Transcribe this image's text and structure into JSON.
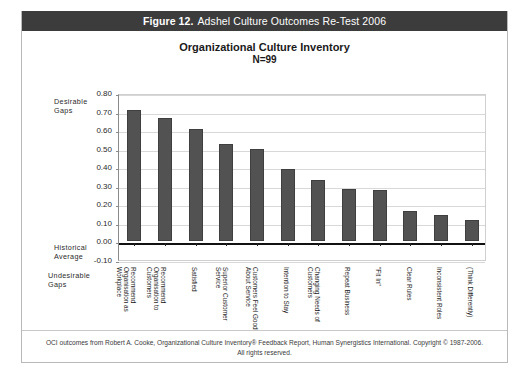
{
  "figure": {
    "number_label": "Figure 12.",
    "caption": "Adshel Culture Outcomes Re-Test 2006"
  },
  "chart_title": "Organizational Culture Inventory",
  "chart_subtitle": "N=99",
  "annotations": {
    "desirable": "Desirable\nGaps",
    "desirable_line1": "Desirable",
    "desirable_line2": "Gaps",
    "historical_line1": "Historical",
    "historical_line2": "Average",
    "undesirable_line1": "Undesirable",
    "undesirable_line2": "Gaps"
  },
  "footer": {
    "line1": "OCI outcomes from Robert A. Cooke, Organizational Culture Inventory® Feedback Report, Human Synergistics International. Copyright © 1987-2006.",
    "line2": "All rights reserved."
  },
  "chart_data": {
    "type": "bar",
    "title": "Organizational Culture Inventory",
    "subtitle": "N=99",
    "xlabel": "",
    "ylabel": "",
    "ylim": [
      -0.1,
      0.8
    ],
    "ytick_labels": [
      "0.80",
      "0.70",
      "0.60",
      "0.50",
      "0.40",
      "0.30",
      "0.20",
      "0.10",
      "0.00",
      "-0.10"
    ],
    "ytick_values": [
      0.8,
      0.7,
      0.6,
      0.5,
      0.4,
      0.3,
      0.2,
      0.1,
      0.0,
      -0.1
    ],
    "grid": true,
    "legend": "none",
    "bar_color": "#525252",
    "categories": [
      "Recommend Organisation as Workplace",
      "Recommend Organisation to Customers",
      "Satisfied",
      "Superior Customer Service",
      "Customers Feel Good About Service",
      "Intention to Stay",
      "Changing Needs of Customers",
      "Repeat Business",
      "\"Fit In\"",
      "Clear Rules",
      "Inconsistent Roles",
      "(Think Differently)"
    ],
    "category_lines": [
      [
        "Recommend",
        "Organisation as",
        "Workplace"
      ],
      [
        "Recommend",
        "Organisation to",
        "Customers"
      ],
      [
        "Satisfied"
      ],
      [
        "Superior Customer",
        "Service"
      ],
      [
        "Customers Feel Good",
        "About Service"
      ],
      [
        "Intention to Stay"
      ],
      [
        "Changing Needs of",
        "Customers"
      ],
      [
        "Repeat Business"
      ],
      [
        "\"Fit In\""
      ],
      [
        "Clear Rules"
      ],
      [
        "Inconsistent Roles"
      ],
      [
        "(Think Differently)"
      ]
    ],
    "values": [
      0.71,
      0.665,
      0.605,
      0.525,
      0.5,
      0.39,
      0.33,
      0.285,
      0.275,
      0.165,
      0.14,
      0.115
    ]
  }
}
